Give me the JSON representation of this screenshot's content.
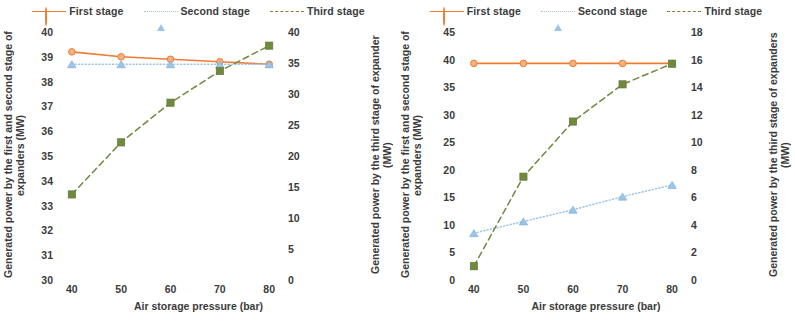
{
  "figure": {
    "panels": [
      {
        "id": "left",
        "legend": [
          {
            "label": "First stage",
            "marker": "circle",
            "line": "solid",
            "color": "#ED7D31"
          },
          {
            "label": "Second stage",
            "marker": "triangle",
            "line": "dotted",
            "color": "#9DC3E6"
          },
          {
            "label": "Third stage",
            "marker": "square",
            "line": "dashed",
            "color": "#70893F"
          }
        ],
        "primary_axis_title": "Generated power by the first and second stage of expanders (MW)",
        "secondary_axis_title": "Generated power by the third stage of expander (MW)",
        "x_axis_title": "Air storage pressure (bar)",
        "x_ticks": [
          "40",
          "50",
          "60",
          "70",
          "80"
        ],
        "primary_ticks": [
          "40",
          "39",
          "38",
          "37",
          "36",
          "35",
          "34",
          "33",
          "32",
          "31",
          "30"
        ],
        "secondary_ticks": [
          "40",
          "35",
          "30",
          "25",
          "20",
          "15",
          "10",
          "5",
          "0"
        ]
      },
      {
        "id": "right",
        "legend": [
          {
            "label": "First stage",
            "marker": "circle",
            "line": "solid",
            "color": "#ED7D31"
          },
          {
            "label": "Second stage",
            "marker": "triangle",
            "line": "dotted",
            "color": "#9DC3E6"
          },
          {
            "label": "Third stage",
            "marker": "square",
            "line": "dashed",
            "color": "#70893F"
          }
        ],
        "primary_axis_title": "Generated power by the first and second stage of expanders (MW)",
        "secondary_axis_title": "Generated power by the third stage of expanders (MW)",
        "x_axis_title": "Air storage pressure (bar)",
        "x_ticks": [
          "40",
          "50",
          "60",
          "70",
          "80"
        ],
        "primary_ticks": [
          "45",
          "40",
          "35",
          "30",
          "25",
          "20",
          "15",
          "10",
          "5",
          "0"
        ],
        "secondary_ticks": [
          "18",
          "16",
          "14",
          "12",
          "10",
          "8",
          "6",
          "4",
          "2",
          "0"
        ]
      }
    ]
  },
  "chart_data": [
    {
      "type": "line",
      "title": "",
      "xlabel": "Air storage pressure (bar)",
      "ylabel": "Generated power by the first and second stage of expanders (MW)",
      "y2label": "Generated power by the third stage of expander (MW)",
      "x": [
        40,
        50,
        60,
        70,
        80
      ],
      "xlim": [
        37,
        83
      ],
      "ylim": [
        30,
        40
      ],
      "y2lim": [
        0,
        40
      ],
      "grid": false,
      "legend_position": "top-center",
      "series": [
        {
          "name": "First stage",
          "axis": "primary",
          "values": [
            39.2,
            39.0,
            38.9,
            38.8,
            38.7
          ],
          "color": "#ED7D31",
          "marker": "circle",
          "line": "solid"
        },
        {
          "name": "Second stage",
          "axis": "primary",
          "values": [
            38.7,
            38.7,
            38.7,
            38.7,
            38.7
          ],
          "color": "#9DC3E6",
          "marker": "triangle",
          "line": "dotted"
        },
        {
          "name": "Third stage",
          "axis": "secondary",
          "values": [
            13.8,
            22.2,
            28.6,
            33.7,
            37.8
          ],
          "color": "#70893F",
          "marker": "square",
          "line": "dashed"
        }
      ]
    },
    {
      "type": "line",
      "title": "",
      "xlabel": "Air storage pressure (bar)",
      "ylabel": "Generated power by the first and second stage of expanders (MW)",
      "y2label": "Generated power by the third stage of expanders (MW)",
      "x": [
        40,
        50,
        60,
        70,
        80
      ],
      "xlim": [
        37,
        83
      ],
      "ylim": [
        0,
        45
      ],
      "y2lim": [
        0,
        18
      ],
      "grid": false,
      "legend_position": "top-center",
      "series": [
        {
          "name": "First stage",
          "axis": "primary",
          "values": [
            39.3,
            39.3,
            39.3,
            39.3,
            39.3
          ],
          "color": "#ED7D31",
          "marker": "circle",
          "line": "solid"
        },
        {
          "name": "Second stage",
          "axis": "secondary",
          "values": [
            3.4,
            4.25,
            5.1,
            6.05,
            6.9
          ],
          "color": "#9DC3E6",
          "marker": "triangle",
          "line": "dotted"
        },
        {
          "name": "Third stage",
          "axis": "secondary",
          "values": [
            1.0,
            7.5,
            11.5,
            14.2,
            15.7
          ],
          "color": "#70893F",
          "marker": "square",
          "line": "dashed"
        }
      ]
    }
  ]
}
